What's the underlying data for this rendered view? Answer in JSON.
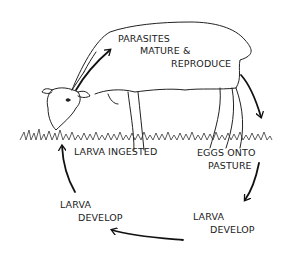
{
  "diagram": {
    "stages": [
      {
        "id": "parasites",
        "lines": [
          "PARASITES",
          "MATURE &",
          "REPRODUCE"
        ]
      },
      {
        "id": "eggs",
        "lines": [
          "EGGS ONTO",
          "PASTURE"
        ]
      },
      {
        "id": "larva-develop-right",
        "lines": [
          "LARVA",
          "DEVELOP"
        ]
      },
      {
        "id": "larva-develop-left",
        "lines": [
          "LARVA",
          "DEVELOP"
        ]
      },
      {
        "id": "larva-ingested",
        "lines": [
          "LARVA INGESTED"
        ]
      }
    ],
    "colors": {
      "ink": "#222222",
      "background": "#ffffff"
    }
  }
}
